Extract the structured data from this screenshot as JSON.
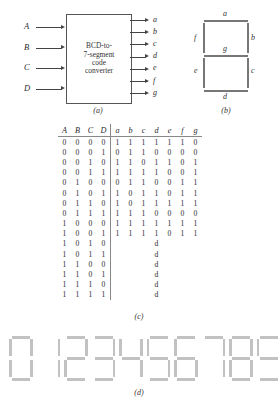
{
  "figure_a": {
    "block_lines": [
      "BCD-to-",
      "7-segment",
      "code",
      "converter"
    ],
    "inputs": [
      "A",
      "B",
      "C",
      "D"
    ],
    "outputs": [
      "a",
      "b",
      "c",
      "d",
      "e",
      "f",
      "g"
    ],
    "caption": "(a)"
  },
  "figure_b": {
    "segment_labels": {
      "a": "a",
      "b": "b",
      "c": "c",
      "d": "d",
      "e": "e",
      "f": "f",
      "g": "g"
    },
    "caption": "(b)"
  },
  "figure_c": {
    "caption": "(c)",
    "input_headers": [
      "A",
      "B",
      "C",
      "D"
    ],
    "output_headers": [
      "a",
      "b",
      "c",
      "d",
      "e",
      "f",
      "g"
    ],
    "dont_care_symbol": "d",
    "rows": [
      {
        "inputs": [
          "0",
          "0",
          "0",
          "0"
        ],
        "outputs": [
          "1",
          "1",
          "1",
          "1",
          "1",
          "1",
          "0"
        ],
        "dont_care": false
      },
      {
        "inputs": [
          "0",
          "0",
          "0",
          "1"
        ],
        "outputs": [
          "0",
          "1",
          "1",
          "0",
          "0",
          "0",
          "0"
        ],
        "dont_care": false
      },
      {
        "inputs": [
          "0",
          "0",
          "1",
          "0"
        ],
        "outputs": [
          "1",
          "1",
          "0",
          "1",
          "1",
          "0",
          "1"
        ],
        "dont_care": false
      },
      {
        "inputs": [
          "0",
          "0",
          "1",
          "1"
        ],
        "outputs": [
          "1",
          "1",
          "1",
          "1",
          "0",
          "0",
          "1"
        ],
        "dont_care": false
      },
      {
        "inputs": [
          "0",
          "1",
          "0",
          "0"
        ],
        "outputs": [
          "0",
          "1",
          "1",
          "0",
          "0",
          "1",
          "1"
        ],
        "dont_care": false
      },
      {
        "inputs": [
          "0",
          "1",
          "0",
          "1"
        ],
        "outputs": [
          "1",
          "0",
          "1",
          "1",
          "0",
          "1",
          "1"
        ],
        "dont_care": false
      },
      {
        "inputs": [
          "0",
          "1",
          "1",
          "0"
        ],
        "outputs": [
          "1",
          "0",
          "1",
          "1",
          "1",
          "1",
          "1"
        ],
        "dont_care": false
      },
      {
        "inputs": [
          "0",
          "1",
          "1",
          "1"
        ],
        "outputs": [
          "1",
          "1",
          "1",
          "0",
          "0",
          "0",
          "0"
        ],
        "dont_care": false
      },
      {
        "inputs": [
          "1",
          "0",
          "0",
          "0"
        ],
        "outputs": [
          "1",
          "1",
          "1",
          "1",
          "1",
          "1",
          "1"
        ],
        "dont_care": false
      },
      {
        "inputs": [
          "1",
          "0",
          "0",
          "1"
        ],
        "outputs": [
          "1",
          "1",
          "1",
          "1",
          "0",
          "1",
          "1"
        ],
        "dont_care": false
      },
      {
        "inputs": [
          "1",
          "0",
          "1",
          "0"
        ],
        "outputs": [],
        "dont_care": true
      },
      {
        "inputs": [
          "1",
          "0",
          "1",
          "1"
        ],
        "outputs": [],
        "dont_care": true
      },
      {
        "inputs": [
          "1",
          "1",
          "0",
          "0"
        ],
        "outputs": [],
        "dont_care": true
      },
      {
        "inputs": [
          "1",
          "1",
          "0",
          "1"
        ],
        "outputs": [],
        "dont_care": true
      },
      {
        "inputs": [
          "1",
          "1",
          "1",
          "0"
        ],
        "outputs": [],
        "dont_care": true
      },
      {
        "inputs": [
          "1",
          "1",
          "1",
          "1"
        ],
        "outputs": [],
        "dont_care": true
      }
    ]
  },
  "figure_d": {
    "caption": "(d)",
    "digits": [
      {
        "value": "0",
        "segments": [
          "a",
          "b",
          "c",
          "d",
          "e",
          "f"
        ]
      },
      {
        "value": "1",
        "segments": [
          "b",
          "c"
        ]
      },
      {
        "value": "2",
        "segments": [
          "a",
          "b",
          "d",
          "e",
          "g"
        ]
      },
      {
        "value": "3",
        "segments": [
          "a",
          "b",
          "c",
          "d",
          "g"
        ]
      },
      {
        "value": "4",
        "segments": [
          "b",
          "c",
          "f",
          "g"
        ]
      },
      {
        "value": "5",
        "segments": [
          "a",
          "c",
          "d",
          "f",
          "g"
        ]
      },
      {
        "value": "6",
        "segments": [
          "a",
          "c",
          "d",
          "e",
          "f",
          "g"
        ]
      },
      {
        "value": "7",
        "segments": [
          "a",
          "b",
          "c"
        ]
      },
      {
        "value": "8",
        "segments": [
          "a",
          "b",
          "c",
          "d",
          "e",
          "f",
          "g"
        ]
      },
      {
        "value": "9",
        "segments": [
          "a",
          "b",
          "c",
          "d",
          "f",
          "g"
        ]
      }
    ]
  }
}
